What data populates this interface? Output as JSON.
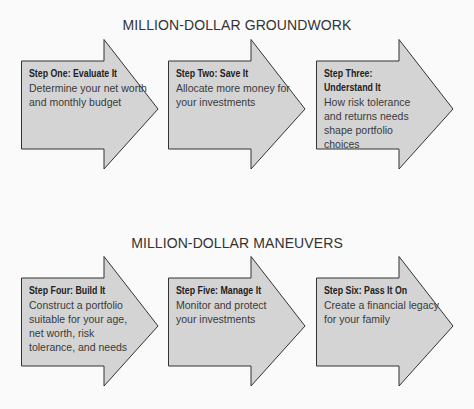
{
  "sections": [
    {
      "title": "MILLION-DOLLAR GROUNDWORK",
      "steps": [
        {
          "title": "Step One: Evaluate It",
          "description": "Determine your net worth and monthly budget"
        },
        {
          "title": "Step Two: Save It",
          "description": "Allocate more money for your investments"
        },
        {
          "title": "Step Three: Understand It",
          "description": "How risk tolerance and returns needs shape portfolio choices"
        }
      ]
    },
    {
      "title": "MILLION-DOLLAR MANEUVERS",
      "steps": [
        {
          "title": "Step Four: Build It",
          "description": "Construct a portfolio suitable for your age, net worth, risk tolerance, and needs"
        },
        {
          "title": "Step Five: Manage It",
          "description": "Monitor and protect your investments"
        },
        {
          "title": "Step Six: Pass It On",
          "description": "Create a financial legacy for your family"
        }
      ]
    }
  ],
  "colors": {
    "arrow_fill": "#d4d4d4",
    "arrow_stroke": "#333333",
    "background": "#fafafa"
  }
}
